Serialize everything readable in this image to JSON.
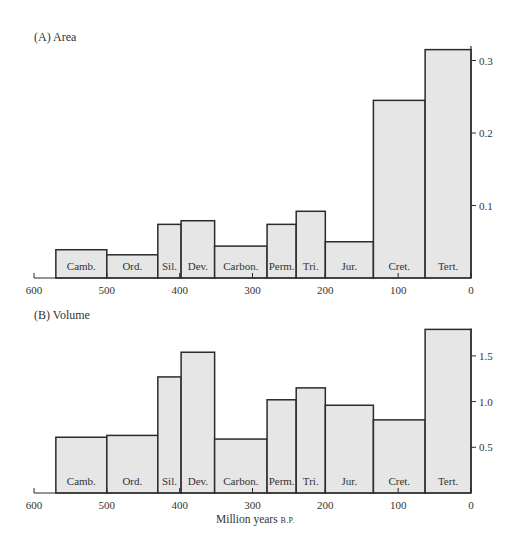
{
  "chart_data": [
    {
      "type": "bar",
      "title": "(A) Area",
      "xlabel": "",
      "ylabel": "",
      "x_axis": {
        "ticks": [
          600,
          500,
          400,
          300,
          200,
          100,
          0
        ],
        "range": [
          600,
          0
        ],
        "reversed": true
      },
      "y_axis": {
        "ticks": [
          0.1,
          0.2,
          0.3
        ],
        "tick_labels": [
          "0.1",
          "0.2",
          "0.3"
        ],
        "range": [
          0,
          0.32
        ],
        "position": "right"
      },
      "grid": false,
      "bars": [
        {
          "label": "Camb.",
          "start": 570,
          "end": 500,
          "value": 0.039
        },
        {
          "label": "Ord.",
          "start": 500,
          "end": 430,
          "value": 0.032
        },
        {
          "label": "Sil.",
          "start": 430,
          "end": 398,
          "value": 0.074
        },
        {
          "label": "Dev.",
          "start": 398,
          "end": 352,
          "value": 0.079
        },
        {
          "label": "Carbon.",
          "start": 352,
          "end": 280,
          "value": 0.044
        },
        {
          "label": "Perm.",
          "start": 280,
          "end": 240,
          "value": 0.074
        },
        {
          "label": "Tri.",
          "start": 240,
          "end": 200,
          "value": 0.092
        },
        {
          "label": "Jur.",
          "start": 200,
          "end": 134,
          "value": 0.05
        },
        {
          "label": "Cret.",
          "start": 134,
          "end": 63,
          "value": 0.245
        },
        {
          "label": "Tert.",
          "start": 63,
          "end": 0,
          "value": 0.315
        }
      ]
    },
    {
      "type": "bar",
      "title": "(B) Volume",
      "xlabel": "Million years B.P.",
      "ylabel": "",
      "x_axis": {
        "ticks": [
          600,
          500,
          400,
          300,
          200,
          100,
          0
        ],
        "range": [
          600,
          0
        ],
        "reversed": true
      },
      "y_axis": {
        "ticks": [
          0.5,
          1.0,
          1.5
        ],
        "tick_labels": [
          "0.5",
          "1.0",
          "1.5"
        ],
        "range": [
          0,
          1.8
        ],
        "position": "right"
      },
      "grid": false,
      "bars": [
        {
          "label": "Camb.",
          "start": 570,
          "end": 500,
          "value": 0.61
        },
        {
          "label": "Ord.",
          "start": 500,
          "end": 430,
          "value": 0.63
        },
        {
          "label": "Sil.",
          "start": 430,
          "end": 398,
          "value": 1.27
        },
        {
          "label": "Dev.",
          "start": 398,
          "end": 352,
          "value": 1.54
        },
        {
          "label": "Carbon.",
          "start": 352,
          "end": 280,
          "value": 0.59
        },
        {
          "label": "Perm.",
          "start": 280,
          "end": 240,
          "value": 1.02
        },
        {
          "label": "Tri.",
          "start": 240,
          "end": 200,
          "value": 1.15
        },
        {
          "label": "Jur.",
          "start": 200,
          "end": 134,
          "value": 0.96
        },
        {
          "label": "Cret.",
          "start": 134,
          "end": 63,
          "value": 0.8
        },
        {
          "label": "Tert.",
          "start": 63,
          "end": 0,
          "value": 1.79
        }
      ]
    }
  ],
  "panels": {
    "a": {
      "title": "(A) Area"
    },
    "b": {
      "title": "(B) Volume"
    }
  },
  "axis": {
    "x_title_main": "Million years ",
    "x_title_small": "B.P."
  },
  "colors": {
    "bar_fill": "#e6e6e6",
    "bar_stroke": "#2b2b2b",
    "axis": "#2b2b2b",
    "text": "#333333"
  }
}
